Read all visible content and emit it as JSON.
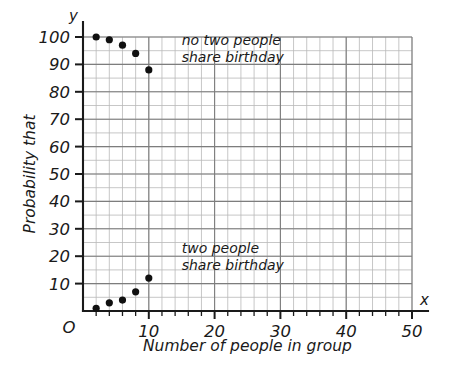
{
  "chart_data": {
    "type": "scatter",
    "title": "",
    "xlabel": "Number of people in group",
    "ylabel": "Probability that",
    "x_axis_name": "x",
    "y_axis_name": "y",
    "origin_label": "O",
    "xlim": [
      0,
      50
    ],
    "ylim": [
      0,
      100
    ],
    "grid": true,
    "grid_minor_step_x": 2,
    "grid_minor_step_y": 5,
    "legend_position": "none",
    "xticks": [
      10,
      20,
      30,
      40,
      50
    ],
    "xtick_labels": [
      "10",
      "20",
      "30",
      "40",
      "50"
    ],
    "xticks_minor_step": 2,
    "yticks": [
      10,
      20,
      30,
      40,
      50,
      60,
      70,
      80,
      90,
      100
    ],
    "ytick_labels": [
      "10",
      "20",
      "30",
      "40",
      "50",
      "60",
      "70",
      "80",
      "90",
      "100"
    ],
    "yticks_minor_step": 5,
    "x": [
      2,
      4,
      6,
      8,
      10
    ],
    "series": [
      {
        "name": "no two people share birthday",
        "values": [
          100,
          99,
          97,
          94,
          88
        ]
      },
      {
        "name": "two people share birthday",
        "values": [
          1,
          3,
          4,
          7,
          12
        ]
      }
    ],
    "annotations": [
      {
        "id": "upper",
        "line1": "no two people",
        "line2": "share birthday",
        "x": 15,
        "y": 97
      },
      {
        "id": "lower",
        "line1": "two people",
        "line2": "share birthday",
        "x": 15,
        "y": 21
      }
    ],
    "colors": {
      "point": "#101010",
      "axis": "#1a1a1a",
      "grid_minor": "#b9b9b9",
      "grid_major": "#7d7d7d",
      "background": "#ffffff"
    }
  }
}
